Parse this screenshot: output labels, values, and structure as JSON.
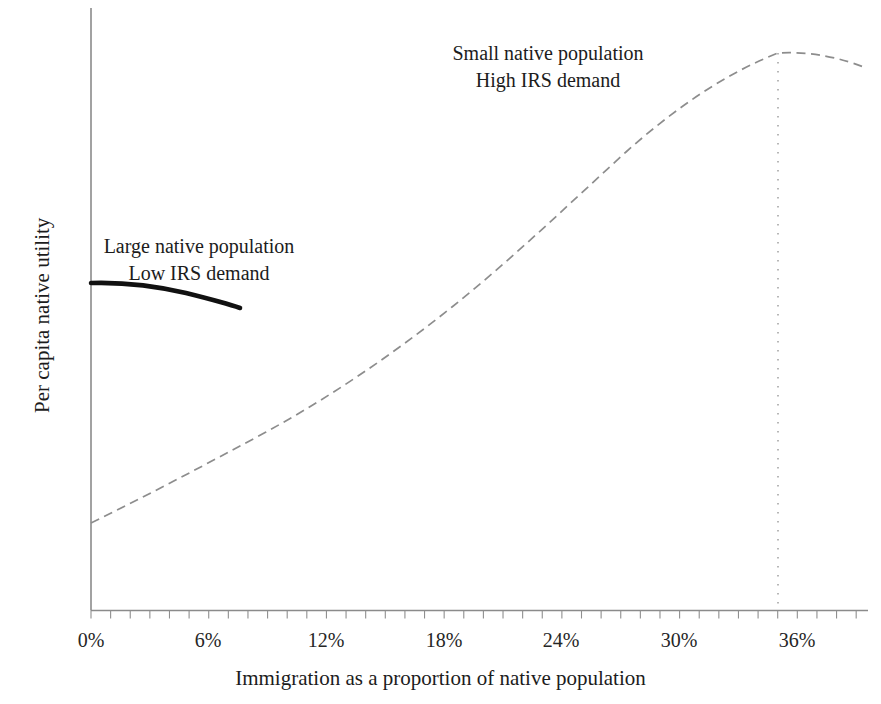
{
  "chart_data": {
    "type": "line",
    "title": "",
    "xlabel": "Immigration as a proportion of native population",
    "ylabel": "Per capita native utility",
    "xtick_labels": [
      "0%",
      "6%",
      "12%",
      "18%",
      "24%",
      "30%",
      "36%"
    ],
    "xtick_values": [
      0,
      6,
      12,
      18,
      24,
      30,
      36
    ],
    "xlim": [
      0,
      39.6
    ],
    "ylim": [
      0,
      1
    ],
    "minor_tick_interval": 1,
    "grid": false,
    "legend": "none",
    "y_axis_ticks": false,
    "y_axis_numeric_labels": false,
    "series": [
      {
        "name": "Small native population / High IRS demand",
        "style": "dashed",
        "color": "#8d8d8d",
        "x": [
          0,
          2,
          4,
          6,
          8,
          10,
          12,
          14,
          16,
          18,
          20,
          22,
          24,
          26,
          28,
          30,
          32,
          35,
          37,
          39.5
        ],
        "y": [
          0.145,
          0.212,
          0.278,
          0.343,
          0.407,
          0.468,
          0.527,
          0.584,
          0.637,
          0.687,
          0.733,
          0.775,
          0.813,
          0.846,
          0.874,
          0.896,
          0.911,
          0.924,
          0.921,
          0.9
        ]
      },
      {
        "name": "Large native population / Low IRS demand",
        "style": "solid-bold",
        "color": "#111111",
        "x": [
          0,
          1.5,
          3,
          4.5,
          6,
          7.6
        ],
        "y": [
          0.543,
          0.541,
          0.535,
          0.525,
          0.51,
          0.502
        ]
      }
    ],
    "annotations": [
      {
        "name": "small-native-population-label",
        "lines": [
          "Small native population",
          "High IRS demand"
        ],
        "x": 23.3,
        "y": 0.945
      },
      {
        "name": "large-native-population-label",
        "lines": [
          "Large native population",
          "Low IRS demand"
        ],
        "x": 9.0,
        "y": 0.62
      }
    ],
    "markers": [
      {
        "name": "optimum-immigration-marker",
        "style": "dotted-vertical",
        "x": 35,
        "color": "#a0a0a0"
      }
    ]
  }
}
